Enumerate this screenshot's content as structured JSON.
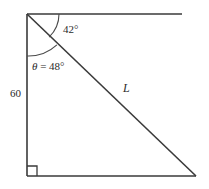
{
  "figure": {
    "type": "right-triangle-geometry-diagram",
    "labels": {
      "angle_top": "42°",
      "angle_theta": "θ",
      "angle_theta_equals": " = 48°",
      "angle_theta_full": "θ = 48°",
      "side_vertical": "60",
      "hypotenuse": "L"
    },
    "colors": {
      "line": "#3a3a3a",
      "arc": "#4a4a4a",
      "text": "#2b2b2b",
      "background": "#ffffff"
    },
    "geometry": {
      "apex": [
        27,
        14
      ],
      "bottom_left": [
        27,
        176
      ],
      "bottom_right": [
        196,
        176
      ],
      "top_ray_end": [
        182,
        14
      ],
      "vertical_length_px": 162,
      "arc_radius_inner": 32,
      "arc_radius_outer": 42,
      "right_angle_marker_size": 10
    },
    "values": {
      "angle_top_degrees": 42,
      "angle_theta_degrees": 48,
      "side_vertical_value": 60
    }
  }
}
